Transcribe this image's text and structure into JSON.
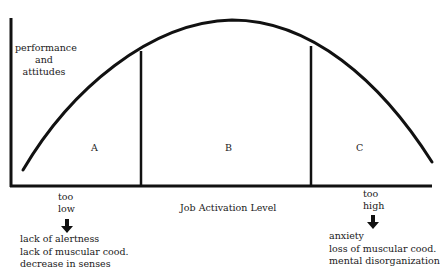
{
  "diagram": {
    "y_axis_label": [
      "performance",
      "and",
      "attitudes"
    ],
    "x_axis_label": "Job Activation Level",
    "curve_shape": "inverted-U",
    "regions": [
      {
        "id": "A",
        "label": "A"
      },
      {
        "id": "B",
        "label": "B"
      },
      {
        "id": "C",
        "label": "C"
      }
    ],
    "low_end": {
      "label": [
        "too",
        "low"
      ],
      "arrow_icon": "down-arrow-icon",
      "effects": [
        "lack of alertness",
        "lack of muscular cood.",
        "decrease in senses"
      ]
    },
    "high_end": {
      "label": [
        "too",
        "high"
      ],
      "arrow_icon": "down-arrow-icon",
      "effects": [
        "anxiety",
        "loss of muscular cood.",
        "mental disorganization"
      ]
    },
    "line_color": "#111111"
  }
}
